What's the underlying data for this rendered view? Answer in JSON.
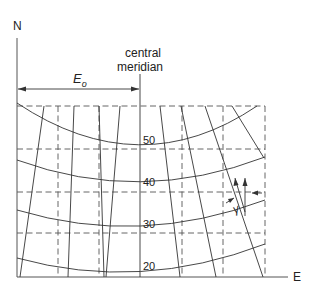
{
  "diagram": {
    "axes": {
      "north_label": "N",
      "east_label": "E"
    },
    "central_meridian": {
      "line1": "central",
      "line2": "meridian"
    },
    "false_easting": {
      "label": "E",
      "subscript": "o"
    },
    "parallels": [
      {
        "label": "50"
      },
      {
        "label": "40"
      },
      {
        "label": "30"
      },
      {
        "label": "20"
      }
    ],
    "convergence_angle": {
      "label": "γ"
    },
    "colors": {
      "line": "#333333",
      "background": "#ffffff"
    }
  }
}
